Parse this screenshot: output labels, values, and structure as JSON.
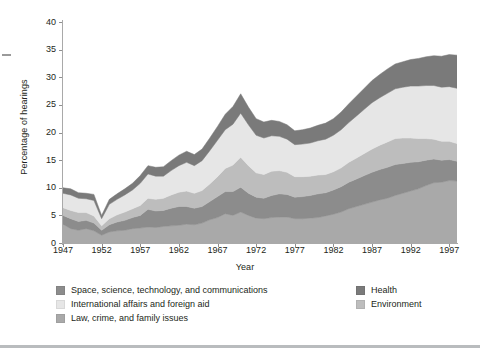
{
  "chart_data": {
    "type": "area",
    "stacked": true,
    "title": "",
    "subtitle": "",
    "xlabel": "Year",
    "ylabel": "Percentage of hearings",
    "xlim": [
      1947,
      1998
    ],
    "ylim": [
      0,
      40
    ],
    "ytick_step": 5,
    "xtick_step": 5,
    "grid": false,
    "legend_position": "bottom",
    "x": [
      1947,
      1948,
      1949,
      1950,
      1951,
      1952,
      1953,
      1954,
      1955,
      1956,
      1957,
      1958,
      1959,
      1960,
      1961,
      1962,
      1963,
      1964,
      1965,
      1966,
      1967,
      1968,
      1969,
      1970,
      1971,
      1972,
      1973,
      1974,
      1975,
      1976,
      1977,
      1978,
      1979,
      1980,
      1981,
      1982,
      1983,
      1984,
      1985,
      1986,
      1987,
      1988,
      1989,
      1990,
      1991,
      1992,
      1993,
      1994,
      1995,
      1996,
      1997,
      1998
    ],
    "xticks": [
      1947,
      1952,
      1957,
      1962,
      1967,
      1972,
      1977,
      1982,
      1987,
      1992,
      1997
    ],
    "yticks": [
      0,
      5,
      10,
      15,
      20,
      25,
      30,
      35,
      40
    ],
    "series": [
      {
        "name": "Law, crime, and family issues",
        "color": "#a9a9a9",
        "values": [
          3.4,
          2.6,
          2.3,
          2.6,
          2.2,
          1.4,
          2.0,
          2.2,
          2.3,
          2.6,
          2.7,
          2.9,
          2.8,
          3.0,
          3.1,
          3.2,
          3.4,
          3.3,
          3.6,
          4.2,
          4.6,
          5.3,
          5.0,
          5.6,
          5.0,
          4.5,
          4.4,
          4.6,
          4.7,
          4.7,
          4.4,
          4.4,
          4.5,
          4.6,
          4.9,
          5.2,
          5.6,
          6.2,
          6.6,
          7.0,
          7.4,
          7.8,
          8.1,
          8.6,
          9.0,
          9.4,
          9.8,
          10.4,
          10.9,
          11.0,
          11.3,
          11.2
        ]
      },
      {
        "name": "Space, science, technology, and communications",
        "color": "#8c8c8c",
        "values": [
          1.6,
          1.8,
          1.6,
          1.5,
          1.4,
          0.9,
          1.3,
          1.6,
          1.8,
          2.0,
          2.3,
          3.2,
          3.0,
          2.9,
          3.2,
          3.4,
          3.2,
          3.0,
          3.0,
          3.3,
          3.8,
          4.0,
          4.3,
          4.5,
          4.0,
          3.8,
          3.7,
          4.0,
          4.2,
          4.1,
          3.9,
          4.0,
          4.1,
          4.3,
          4.2,
          4.4,
          4.6,
          4.8,
          5.0,
          5.2,
          5.4,
          5.5,
          5.6,
          5.6,
          5.4,
          5.2,
          4.9,
          4.6,
          4.3,
          4.0,
          3.8,
          3.6
        ]
      },
      {
        "name": "Environment",
        "color": "#bdbdbd",
        "values": [
          1.4,
          1.5,
          1.6,
          1.4,
          1.3,
          0.8,
          1.1,
          1.3,
          1.5,
          1.6,
          1.8,
          2.0,
          2.1,
          2.2,
          2.4,
          2.6,
          2.8,
          2.7,
          2.9,
          3.2,
          3.6,
          4.2,
          4.8,
          5.4,
          5.0,
          4.4,
          4.3,
          4.4,
          4.2,
          4.0,
          3.7,
          3.6,
          3.5,
          3.4,
          3.3,
          3.3,
          3.4,
          3.6,
          3.8,
          4.0,
          4.2,
          4.4,
          4.6,
          4.7,
          4.6,
          4.4,
          4.2,
          3.9,
          3.6,
          3.4,
          3.3,
          3.2
        ]
      },
      {
        "name": "International affairs and foreign aid",
        "color": "#e6e6e6",
        "values": [
          2.6,
          2.8,
          2.6,
          2.5,
          2.8,
          1.3,
          2.6,
          2.8,
          3.1,
          3.4,
          4.0,
          4.4,
          4.2,
          4.0,
          4.4,
          4.8,
          5.2,
          5.0,
          5.4,
          6.0,
          6.6,
          7.0,
          7.4,
          8.0,
          7.4,
          6.8,
          6.6,
          6.4,
          6.2,
          6.0,
          5.8,
          5.9,
          6.0,
          6.2,
          6.4,
          6.6,
          6.9,
          7.2,
          7.6,
          8.0,
          8.4,
          8.6,
          8.8,
          9.0,
          9.2,
          9.4,
          9.5,
          9.6,
          9.7,
          9.8,
          9.9,
          10.0
        ]
      },
      {
        "name": "Health",
        "color": "#7a7a7a",
        "values": [
          1.0,
          1.1,
          1.0,
          1.0,
          1.1,
          0.6,
          0.9,
          1.0,
          1.1,
          1.2,
          1.4,
          1.5,
          1.6,
          1.7,
          1.8,
          1.9,
          2.0,
          2.0,
          2.1,
          2.3,
          2.5,
          2.8,
          3.2,
          3.5,
          3.2,
          3.0,
          2.9,
          2.8,
          2.7,
          2.6,
          2.5,
          2.6,
          2.7,
          2.8,
          2.9,
          3.0,
          3.2,
          3.4,
          3.6,
          3.8,
          4.0,
          4.2,
          4.4,
          4.5,
          4.6,
          4.8,
          5.0,
          5.2,
          5.4,
          5.6,
          5.8,
          6.0
        ]
      }
    ],
    "totals": [
      10.0,
      9.8,
      9.1,
      9.0,
      8.8,
      5.0,
      7.9,
      8.9,
      9.8,
      10.8,
      12.2,
      14.0,
      13.7,
      13.8,
      14.9,
      15.9,
      16.6,
      16.0,
      17.0,
      19.0,
      21.1,
      23.3,
      24.7,
      27.0,
      24.6,
      22.5,
      21.9,
      22.2,
      22.0,
      21.4,
      20.3,
      20.5,
      20.8,
      21.3,
      21.7,
      22.5,
      23.7,
      25.2,
      26.6,
      28.0,
      29.4,
      30.5,
      31.5,
      32.4,
      32.8,
      33.2,
      33.4,
      33.7,
      33.9,
      33.8,
      34.1,
      34.0
    ]
  },
  "legend": {
    "left_column": [
      {
        "label": "Space, science, technology, and communications",
        "color": "#8c8c8c"
      },
      {
        "label": "International affairs and foreign aid",
        "color": "#e6e6e6"
      },
      {
        "label": "Law, crime, and family issues",
        "color": "#a9a9a9"
      }
    ],
    "right_column": [
      {
        "label": "Health",
        "color": "#7a7a7a"
      },
      {
        "label": "Environment",
        "color": "#bdbdbd"
      }
    ]
  }
}
